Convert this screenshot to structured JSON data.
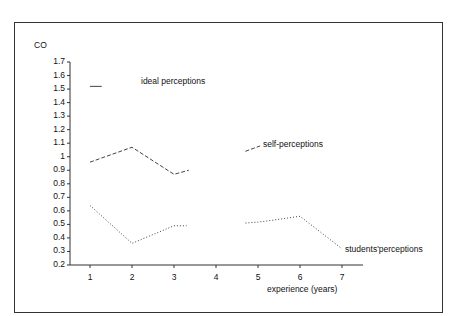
{
  "chart_data": {
    "type": "line",
    "title": "",
    "ylabel": "CO",
    "xlabel": "experience (years)",
    "ylim": [
      0.2,
      1.7
    ],
    "xlim": [
      0.5,
      7.5
    ],
    "x_ticks": [
      "1",
      "2",
      "3",
      "4",
      "5",
      "6",
      "7"
    ],
    "y_ticks": [
      "0.2",
      "0.3",
      "0.4",
      "0.5",
      "0.6",
      "0.7",
      "0.8",
      "0.9",
      "1",
      "1.1",
      "1.2",
      "1.3",
      "1.4",
      "1.5",
      "1.6",
      "1.7"
    ],
    "grid": false,
    "legend": "inline labels",
    "series": [
      {
        "name": "ideal perceptions",
        "style": "solid",
        "segments": [
          [
            [
              1.0,
              1.52
            ],
            [
              1.28,
              1.52
            ]
          ]
        ]
      },
      {
        "name": "self-perceptions",
        "style": "dashed",
        "segments": [
          [
            [
              1,
              0.96
            ],
            [
              2,
              1.07
            ],
            [
              3,
              0.87
            ],
            [
              3.35,
              0.9
            ]
          ],
          [
            [
              4.7,
              1.04
            ],
            [
              5.05,
              1.08
            ]
          ]
        ]
      },
      {
        "name": "students'perceptions",
        "style": "dotted",
        "segments": [
          [
            [
              1,
              0.64
            ],
            [
              2,
              0.36
            ],
            [
              3,
              0.49
            ],
            [
              3.3,
              0.49
            ]
          ],
          [
            [
              4.7,
              0.51
            ],
            [
              5.1,
              0.52
            ],
            [
              6,
              0.56
            ],
            [
              7,
              0.32
            ]
          ]
        ]
      }
    ],
    "annotations": [
      {
        "text": "ideal perceptions",
        "x": 2.2,
        "y": 1.55
      },
      {
        "text": "self-perceptions",
        "x": 5.15,
        "y": 1.08
      },
      {
        "text": "students'perceptions",
        "x": 7.1,
        "y": 0.31
      }
    ]
  },
  "labels": {
    "ylabel": "CO",
    "xlabel": "experience (years)",
    "ideal": "ideal perceptions",
    "self": "self-perceptions",
    "students": "students'perceptions"
  }
}
